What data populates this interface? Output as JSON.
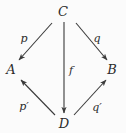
{
  "figure": {
    "kind": "commutative-diagram",
    "background_color": "#fbfbfb",
    "stroke_color": "#3a3a3a",
    "text_color": "#2b2b2b",
    "width": 126,
    "height": 133
  },
  "nodes": [
    {
      "id": "C",
      "label": "C",
      "x": 63,
      "y": 11
    },
    {
      "id": "A",
      "label": "A",
      "x": 11,
      "y": 69
    },
    {
      "id": "B",
      "label": "B",
      "x": 112,
      "y": 69
    },
    {
      "id": "D",
      "label": "D",
      "x": 64,
      "y": 123
    }
  ],
  "edges": [
    {
      "id": "C-A",
      "label": "p",
      "from": "C",
      "to": "A",
      "x1": 52,
      "y1": 23,
      "x2": 19,
      "y2": 60,
      "label_x": 24,
      "label_y": 38,
      "direction": "down-left"
    },
    {
      "id": "C-B",
      "label": "q",
      "from": "C",
      "to": "B",
      "x1": 76,
      "y1": 23,
      "x2": 107,
      "y2": 60,
      "label_x": 97,
      "label_y": 38,
      "direction": "down-right"
    },
    {
      "id": "C-D",
      "label": "f",
      "from": "C",
      "to": "D",
      "x1": 64,
      "y1": 22,
      "x2": 64,
      "y2": 113,
      "label_x": 71,
      "label_y": 70,
      "direction": "down"
    },
    {
      "id": "D-A",
      "label": "p′",
      "from": "D",
      "to": "A",
      "x1": 55,
      "y1": 115,
      "x2": 21,
      "y2": 80,
      "label_x": 24,
      "label_y": 106,
      "direction": "up-left"
    },
    {
      "id": "D-B",
      "label": "q′",
      "from": "D",
      "to": "B",
      "x1": 74,
      "y1": 115,
      "x2": 106,
      "y2": 80,
      "label_x": 97,
      "label_y": 107,
      "direction": "up-right"
    }
  ]
}
